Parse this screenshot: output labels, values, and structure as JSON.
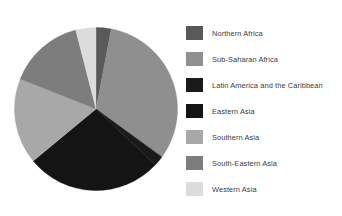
{
  "chart_data": {
    "type": "pie",
    "title": "",
    "subtitle": "",
    "xlabel": "",
    "ylabel": "",
    "legend_position": "right",
    "grid": false,
    "start_angle_deg": 0,
    "direction": "clockwise",
    "categories": [
      "Northern Africa",
      "Sub-Saharan Africa",
      "Latin America and the Caribbean",
      "Eastern Asia",
      "Southern Asia",
      "South-Eastern Asia",
      "Western Asia"
    ],
    "values": [
      3,
      32,
      2,
      27,
      17,
      15,
      4
    ],
    "units": "percent",
    "colors": [
      "#595959",
      "#8f8f8f",
      "#1a1a1a",
      "#141414",
      "#a8a8a8",
      "#7d7d7d",
      "#dcdcdc"
    ],
    "slices": [
      {
        "label": "Northern Africa",
        "value": 3,
        "color": "#595959",
        "start_deg": 0,
        "end_deg": 10.8
      },
      {
        "label": "Sub-Saharan Africa",
        "value": 32,
        "color": "#8f8f8f",
        "start_deg": 10.8,
        "end_deg": 126.0
      },
      {
        "label": "Latin America and the Caribbean",
        "value": 2,
        "color": "#1a1a1a",
        "start_deg": 126.0,
        "end_deg": 133.2
      },
      {
        "label": "Eastern Asia",
        "value": 27,
        "color": "#141414",
        "start_deg": 133.2,
        "end_deg": 230.4
      },
      {
        "label": "Southern Asia",
        "value": 17,
        "color": "#a8a8a8",
        "start_deg": 230.4,
        "end_deg": 291.6
      },
      {
        "label": "South-Eastern Asia",
        "value": 15,
        "color": "#7d7d7d",
        "start_deg": 291.6,
        "end_deg": 345.6
      },
      {
        "label": "Western Asia",
        "value": 4,
        "color": "#dcdcdc",
        "start_deg": 345.6,
        "end_deg": 360.0
      }
    ]
  },
  "legend": {
    "items": [
      {
        "label": "Northern Africa",
        "color": "#595959"
      },
      {
        "label": "Sub-Saharan Africa",
        "color": "#8f8f8f"
      },
      {
        "label": "Latin America and the Caribbean",
        "color": "#1a1a1a"
      },
      {
        "label": "Eastern Asia",
        "color": "#141414"
      },
      {
        "label": "Southern Asia",
        "color": "#a8a8a8"
      },
      {
        "label": "South-Eastern Asia",
        "color": "#7d7d7d"
      },
      {
        "label": "Western Asia",
        "color": "#dcdcdc"
      }
    ]
  },
  "figure": {
    "background_color": "#ffffff",
    "text_color": "#3b3b3b"
  }
}
